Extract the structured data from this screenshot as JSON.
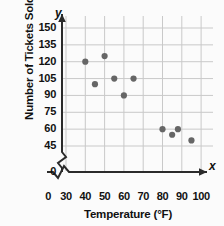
{
  "chart_data": {
    "type": "scatter",
    "title": "",
    "xlabel": "Temperature (°F)",
    "ylabel": "Number of Tickets Sold",
    "x_axis_letter": "x",
    "y_axis_letter": "y",
    "xticks": [
      0,
      30,
      40,
      50,
      60,
      70,
      80,
      90,
      100
    ],
    "yticks": [
      0,
      45,
      60,
      75,
      90,
      105,
      120,
      135,
      150
    ],
    "xlim": [
      30,
      100
    ],
    "ylim": [
      45,
      150
    ],
    "x_axis_break": true,
    "y_axis_break": true,
    "grid": true,
    "legend": "none",
    "point_color": "#666666",
    "grid_color": "#c9c9c9",
    "axis_color": "#2b2b2b",
    "points": [
      {
        "x": 40,
        "y": 120
      },
      {
        "x": 45,
        "y": 100
      },
      {
        "x": 50,
        "y": 125
      },
      {
        "x": 55,
        "y": 105
      },
      {
        "x": 60,
        "y": 90
      },
      {
        "x": 65,
        "y": 105
      },
      {
        "x": 80,
        "y": 60
      },
      {
        "x": 85,
        "y": 55
      },
      {
        "x": 88,
        "y": 60
      },
      {
        "x": 95,
        "y": 50
      }
    ]
  },
  "labels": {
    "y_ticks_text": [
      "150",
      "135",
      "120",
      "105",
      "90",
      "75",
      "60",
      "45",
      "0"
    ],
    "x_ticks_text": [
      "0",
      "30",
      "40",
      "50",
      "60",
      "70",
      "80",
      "90",
      "100"
    ]
  }
}
